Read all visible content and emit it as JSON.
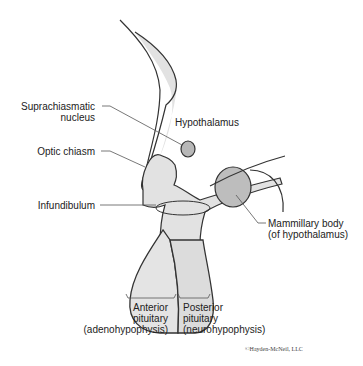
{
  "diagram": {
    "labels": {
      "suprachiasmatic_line1": "Suprachiasmatic",
      "suprachiasmatic_line2": "nucleus",
      "hypothalamus": "Hypothalamus",
      "optic_chiasm": "Optic chiasm",
      "infundibulum": "Infundibulum",
      "mammillary_line1": "Mammillary body",
      "mammillary_line2": "(of hypothalamus)",
      "anterior_line1": "Anterior",
      "anterior_line2": "pituitary",
      "anterior_line3": "(adenohypophysis)",
      "posterior_line1": "Posterior",
      "posterior_line2": "pituitary",
      "posterior_line3": "(neurohypophysis)"
    },
    "copyright": "©Hayden-McNeil, LLC",
    "colors": {
      "fill": "#e2e2e2",
      "stroke": "#333333",
      "dark_fill": "#b8b8b8"
    }
  }
}
